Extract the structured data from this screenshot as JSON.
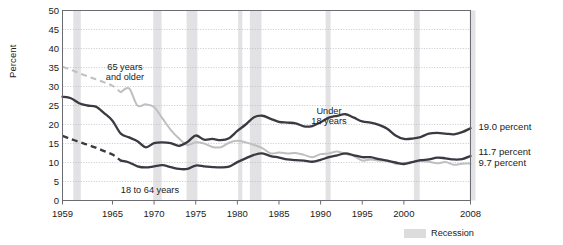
{
  "chart_data": {
    "type": "line",
    "title": "",
    "xlabel": "",
    "ylabel": "Percent",
    "xlim": [
      1959,
      2008
    ],
    "ylim": [
      0,
      50
    ],
    "ytick_step": 5,
    "grid": true,
    "legend_position": "below-right",
    "ytick_labels": [
      "50",
      "45",
      "40",
      "35",
      "30",
      "25",
      "20",
      "15",
      "10",
      "5",
      "0"
    ],
    "xtick_labels": [
      "1959",
      "1965",
      "1970",
      "1975",
      "1980",
      "1985",
      "1990",
      "1995",
      "2000",
      "2008"
    ],
    "xticks": [
      1959,
      1965,
      1970,
      1975,
      1980,
      1985,
      1990,
      1995,
      2000,
      2008
    ],
    "legend": [
      {
        "label": "Recession",
        "color": "#dcdcdc",
        "type": "band"
      }
    ],
    "annotations": [
      {
        "text_line1": "65 years",
        "text_line2": "and older",
        "x": 1966.5,
        "y": 36.5
      },
      {
        "text_line1": "Under",
        "text_line2": "18 years",
        "x": 1991.0,
        "y": 25.0
      },
      {
        "text": "18 to 64 years",
        "x": 1966.0,
        "y": 4.2
      }
    ],
    "end_labels": [
      {
        "text": "19.0 percent",
        "series": "Under 18 years",
        "value": 19.0
      },
      {
        "text": "11.7 percent",
        "series": "18 to 64 years",
        "value": 11.7
      },
      {
        "text": "9.7 percent",
        "series": "65 years and older",
        "value": 9.7
      }
    ],
    "x": [
      1959,
      1960,
      1961,
      1962,
      1963,
      1964,
      1965,
      1966,
      1967,
      1968,
      1969,
      1970,
      1971,
      1972,
      1973,
      1974,
      1975,
      1976,
      1977,
      1978,
      1979,
      1980,
      1981,
      1982,
      1983,
      1984,
      1985,
      1986,
      1987,
      1988,
      1989,
      1990,
      1991,
      1992,
      1993,
      1994,
      1995,
      1996,
      1997,
      1998,
      1999,
      2000,
      2001,
      2002,
      2003,
      2004,
      2005,
      2006,
      2007,
      2008
    ],
    "series": [
      {
        "name": "Under 18 years",
        "color": "#3a3a42",
        "style": "solid",
        "values": [
          27.3,
          26.9,
          25.6,
          25.0,
          24.7,
          23.0,
          21.0,
          17.6,
          16.6,
          15.6,
          14.0,
          15.1,
          15.3,
          15.1,
          14.4,
          15.4,
          17.1,
          16.0,
          16.2,
          15.9,
          16.4,
          18.3,
          20.0,
          21.9,
          22.3,
          21.5,
          20.7,
          20.5,
          20.3,
          19.5,
          19.6,
          20.6,
          21.8,
          22.3,
          22.7,
          21.8,
          20.8,
          20.5,
          19.9,
          18.9,
          17.1,
          16.2,
          16.3,
          16.7,
          17.6,
          17.8,
          17.6,
          17.4,
          18.0,
          19.0
        ]
      },
      {
        "name": "18 to 64 years",
        "color": "#3a3a42",
        "style": "dashed-then-solid",
        "dashed_until": 1966,
        "values": [
          17.0,
          16.2,
          15.4,
          14.7,
          13.9,
          13.0,
          12.1,
          10.5,
          10.0,
          9.0,
          8.7,
          9.0,
          9.3,
          8.8,
          8.3,
          8.3,
          9.2,
          9.0,
          8.8,
          8.7,
          8.9,
          10.1,
          11.1,
          12.0,
          12.4,
          11.7,
          11.3,
          10.8,
          10.6,
          10.5,
          10.2,
          10.7,
          11.4,
          11.9,
          12.4,
          11.9,
          11.4,
          11.4,
          10.9,
          10.5,
          10.0,
          9.6,
          10.1,
          10.6,
          10.8,
          11.3,
          11.1,
          10.8,
          10.9,
          11.7
        ]
      },
      {
        "name": "65 years and older",
        "color": "#bfbfbf",
        "style": "dashed-then-solid",
        "dashed_until": 1966,
        "values": [
          35.2,
          34.4,
          33.5,
          32.7,
          31.9,
          31.1,
          30.2,
          28.5,
          29.5,
          25.0,
          25.3,
          24.6,
          21.6,
          18.6,
          16.3,
          14.6,
          15.3,
          15.0,
          14.1,
          14.0,
          15.2,
          15.7,
          15.3,
          14.6,
          13.8,
          12.4,
          12.6,
          12.4,
          12.5,
          12.0,
          11.4,
          12.2,
          12.4,
          12.9,
          12.2,
          11.7,
          10.5,
          10.8,
          10.5,
          10.5,
          9.7,
          9.9,
          10.1,
          10.4,
          10.2,
          9.8,
          10.1,
          9.4,
          9.7,
          9.7
        ]
      }
    ],
    "recessions": [
      {
        "start": 1960.3,
        "end": 1961.2
      },
      {
        "start": 1969.9,
        "end": 1970.9
      },
      {
        "start": 1973.9,
        "end": 1975.2
      },
      {
        "start": 1980.1,
        "end": 1980.6
      },
      {
        "start": 1981.5,
        "end": 1982.9
      },
      {
        "start": 1990.6,
        "end": 1991.2
      },
      {
        "start": 2001.2,
        "end": 2001.9
      },
      {
        "start": 2007.9,
        "end": 2008.6
      }
    ]
  },
  "colors": {
    "plot_border": "#6b6b72",
    "grid": "#b9b9c2",
    "recession_band": "#e2e2e4",
    "dark_series": "#3a3a42",
    "light_series": "#bfbfbf",
    "background": "#ffffff"
  }
}
